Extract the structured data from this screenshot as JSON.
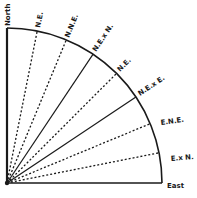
{
  "diagram": {
    "type": "compass-quadrant",
    "origin": [
      7,
      183
    ],
    "radius": 155,
    "ink_color": "#1a1a1a",
    "rays": [
      {
        "id": "north",
        "label": "North",
        "angle_deg": 0,
        "style": "solid"
      },
      {
        "id": "nxe",
        "label": "N.E.",
        "angle_deg": 11.25,
        "style": "dotted"
      },
      {
        "id": "nne",
        "label": "N.N.E.",
        "angle_deg": 22.5,
        "style": "dotted"
      },
      {
        "id": "nexn",
        "label": "N.E.x N.",
        "angle_deg": 33.75,
        "style": "solid"
      },
      {
        "id": "ne",
        "label": "N.E.",
        "angle_deg": 45,
        "style": "dotted"
      },
      {
        "id": "nexe",
        "label": "N.E.x E.",
        "angle_deg": 56.25,
        "style": "solid"
      },
      {
        "id": "ene",
        "label": "E.N.E.",
        "angle_deg": 67.5,
        "style": "dotted"
      },
      {
        "id": "exn",
        "label": "E.x N.",
        "angle_deg": 78.75,
        "style": "dotted"
      },
      {
        "id": "east",
        "label": "East",
        "angle_deg": 90,
        "style": "solid"
      }
    ]
  }
}
